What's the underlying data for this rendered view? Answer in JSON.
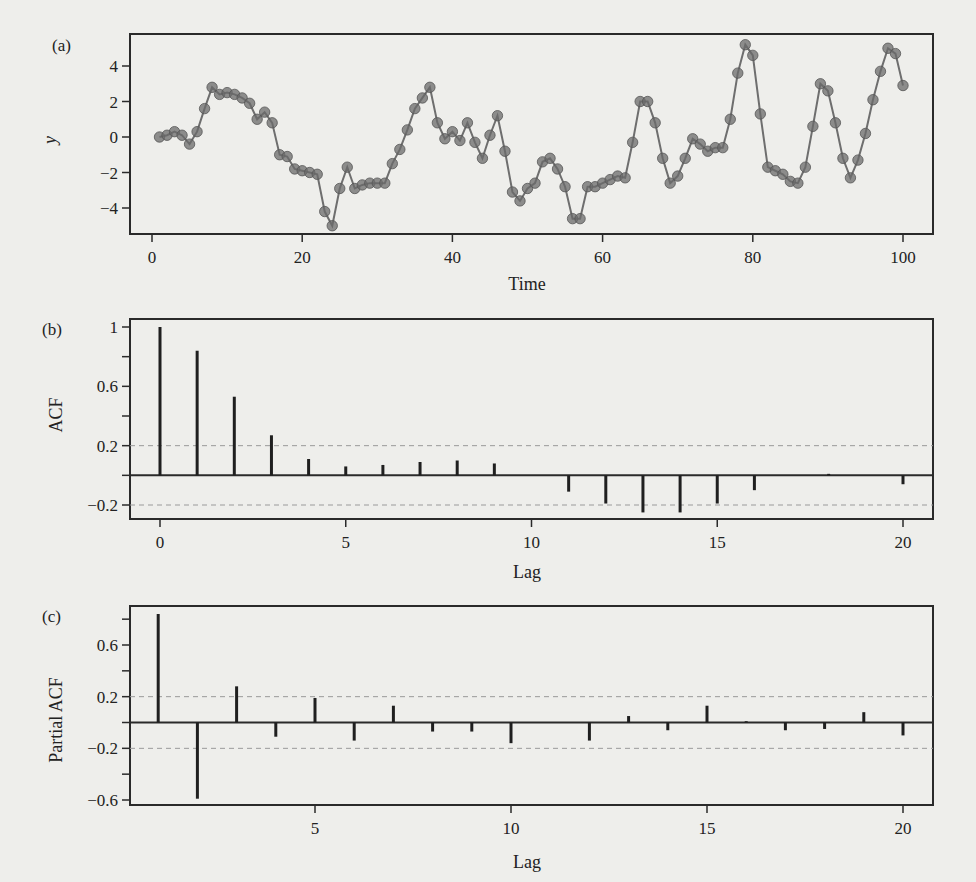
{
  "chart_data": [
    {
      "id": "a",
      "panel_label": "(a)",
      "type": "line",
      "title": "",
      "xlabel": "Time",
      "ylabel": "y",
      "xlim": [
        -1,
        105
      ],
      "ylim": [
        -5.4,
        5.6
      ],
      "xticks": [
        0,
        20,
        40,
        60,
        80,
        100
      ],
      "yticks": [
        -4,
        -2,
        0,
        2,
        4
      ],
      "grid": false,
      "markers": true,
      "x": [
        1,
        2,
        3,
        4,
        5,
        6,
        7,
        8,
        9,
        10,
        11,
        12,
        13,
        14,
        15,
        16,
        17,
        18,
        19,
        20,
        21,
        22,
        23,
        24,
        25,
        26,
        27,
        28,
        29,
        30,
        31,
        32,
        33,
        34,
        35,
        36,
        37,
        38,
        39,
        40,
        41,
        42,
        43,
        44,
        45,
        46,
        47,
        48,
        49,
        50,
        51,
        52,
        53,
        54,
        55,
        56,
        57,
        58,
        59,
        60,
        61,
        62,
        63,
        64,
        65,
        66,
        67,
        68,
        69,
        70,
        71,
        72,
        73,
        74,
        75,
        76,
        77,
        78,
        79,
        80,
        81,
        82,
        83,
        84,
        85,
        86,
        87,
        88,
        89,
        90,
        91,
        92,
        93,
        94,
        95,
        96,
        97,
        98,
        99,
        100
      ],
      "values": [
        0.0,
        0.1,
        0.3,
        0.1,
        -0.4,
        0.3,
        1.6,
        2.8,
        2.4,
        2.5,
        2.4,
        2.2,
        1.9,
        1.0,
        1.4,
        0.8,
        -1.0,
        -1.1,
        -1.8,
        -1.9,
        -2.0,
        -2.1,
        -4.2,
        -5.0,
        -2.9,
        -1.7,
        -2.9,
        -2.7,
        -2.6,
        -2.6,
        -2.6,
        -1.5,
        -0.7,
        0.4,
        1.6,
        2.2,
        2.8,
        0.8,
        -0.1,
        0.3,
        -0.2,
        0.8,
        -0.3,
        -1.2,
        0.1,
        1.2,
        -0.8,
        -3.1,
        -3.6,
        -2.9,
        -2.6,
        -1.4,
        -1.2,
        -1.8,
        -2.8,
        -4.6,
        -4.6,
        -2.8,
        -2.8,
        -2.6,
        -2.4,
        -2.2,
        -2.3,
        -0.3,
        2.0,
        2.0,
        0.8,
        -1.2,
        -2.6,
        -2.2,
        -1.2,
        -0.1,
        -0.4,
        -0.8,
        -0.6,
        -0.6,
        1.0,
        3.6,
        5.2,
        4.6,
        1.3,
        -1.7,
        -1.9,
        -2.1,
        -2.5,
        -2.6,
        -1.7,
        0.6,
        3.0,
        2.6,
        0.8,
        -1.2,
        -2.3,
        -1.3,
        0.2,
        2.1,
        3.7,
        5.0,
        4.7,
        2.9,
        1.0,
        0.5,
        -0.2,
        -1.3,
        0.2,
        1.6,
        0.8
      ],
      "x_series_note": "values correspond to Time = 1..100 (approx. 100 points shown; read from plot)"
    },
    {
      "id": "b",
      "panel_label": "(b)",
      "type": "bar",
      "subtype": "stem",
      "title": "",
      "xlabel": "Lag",
      "ylabel": "ACF",
      "xlim": [
        -0.8,
        20.8
      ],
      "ylim": [
        -0.3,
        1.05
      ],
      "xticks": [
        0,
        5,
        10,
        15,
        20
      ],
      "yticks": [
        -0.2,
        0.2,
        0.6,
        1.0
      ],
      "yticks_minor": [
        0.0,
        0.4,
        0.8
      ],
      "confidence_bounds": [
        0.2,
        -0.2
      ],
      "grid": false,
      "categories": [
        0,
        1,
        2,
        3,
        4,
        5,
        6,
        7,
        8,
        9,
        10,
        11,
        12,
        13,
        14,
        15,
        16,
        17,
        18,
        19,
        20
      ],
      "values": [
        1.0,
        0.84,
        0.53,
        0.27,
        0.11,
        0.06,
        0.07,
        0.09,
        0.1,
        0.08,
        0.0,
        -0.11,
        -0.19,
        -0.25,
        -0.25,
        -0.19,
        -0.1,
        0.0,
        0.01,
        0.0,
        -0.06
      ]
    },
    {
      "id": "c",
      "panel_label": "(c)",
      "type": "bar",
      "subtype": "stem",
      "title": "",
      "xlabel": "Lag",
      "ylabel": "Partial ACF",
      "xlim": [
        0.2,
        20.8
      ],
      "ylim": [
        -0.65,
        0.9
      ],
      "xticks": [
        5,
        10,
        15,
        20
      ],
      "yticks": [
        -0.6,
        -0.2,
        0.2,
        0.6
      ],
      "yticks_minor": [
        -0.4,
        0.0,
        0.4,
        0.8
      ],
      "confidence_bounds": [
        0.2,
        -0.2
      ],
      "grid": false,
      "categories": [
        1,
        2,
        3,
        4,
        5,
        6,
        7,
        8,
        9,
        10,
        11,
        12,
        13,
        14,
        15,
        16,
        17,
        18,
        19,
        20
      ],
      "values": [
        0.84,
        -0.59,
        0.28,
        -0.11,
        0.19,
        -0.14,
        0.13,
        -0.07,
        -0.07,
        -0.16,
        0.0,
        -0.14,
        0.05,
        -0.06,
        0.13,
        0.01,
        -0.06,
        -0.05,
        0.08,
        -0.1
      ]
    }
  ]
}
